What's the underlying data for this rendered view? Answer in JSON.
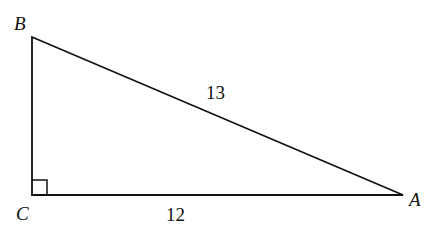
{
  "diagram": {
    "type": "right-triangle",
    "vertices": [
      {
        "label": "B",
        "x": 32,
        "y": 37
      },
      {
        "label": "C",
        "x": 32,
        "y": 195
      },
      {
        "label": "A",
        "x": 403,
        "y": 195
      }
    ],
    "sides": [
      {
        "between": "BA",
        "label": "13"
      },
      {
        "between": "CA",
        "label": "12"
      }
    ],
    "right_angle_at": "C",
    "colors": {
      "stroke": "#111111",
      "background": "#ffffff"
    }
  }
}
